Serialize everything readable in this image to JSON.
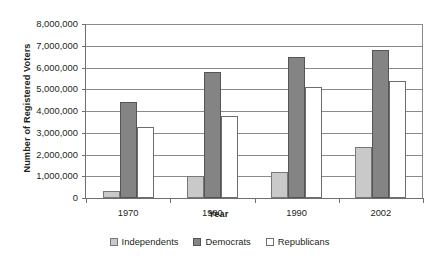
{
  "chart_data": {
    "type": "bar",
    "title": "",
    "xlabel": "Year",
    "ylabel": "Number of Registered Voters",
    "categories": [
      "1970",
      "1980",
      "1990",
      "2002"
    ],
    "series": [
      {
        "name": "Independents",
        "color": "#c9c9c9",
        "values": [
          300000,
          1000000,
          1200000,
          2350000
        ]
      },
      {
        "name": "Democrats",
        "color": "#848484",
        "values": [
          4400000,
          5800000,
          6500000,
          6800000
        ]
      },
      {
        "name": "Republicans",
        "color": "#ffffff",
        "values": [
          3250000,
          3750000,
          5100000,
          5400000
        ]
      }
    ],
    "ylim": [
      0,
      8000000
    ],
    "ytick_values": [
      0,
      1000000,
      2000000,
      3000000,
      4000000,
      5000000,
      6000000,
      7000000,
      8000000
    ],
    "ytick_labels": [
      "0",
      "1,000,000",
      "2,000,000",
      "3,000,000",
      "4,000,000",
      "5,000,000",
      "6,000,000",
      "7,000,000",
      "8,000,000"
    ],
    "grid": true,
    "legend_position": "bottom"
  }
}
